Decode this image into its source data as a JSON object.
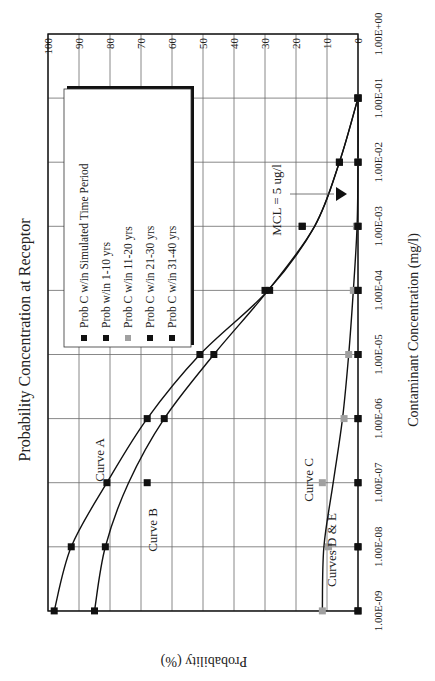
{
  "chart_data": {
    "type": "line",
    "title": "Probability Concentration at Receptor",
    "xlabel": "Contaminant Concentration (mg/l)",
    "ylabel": "Probability (%)",
    "orientation": "rotated 90 degrees clockwise (x-axis runs vertically on page)",
    "x_scale": "log",
    "xlim": [
      1e-09,
      1
    ],
    "ylim": [
      0,
      100
    ],
    "grid": true,
    "x_tick_labels": [
      "1.00E-09",
      "1.00E-08",
      "1.00E-07",
      "1.00E-06",
      "1.00E-05",
      "1.00E-04",
      "1.00E-03",
      "1.00E-02",
      "1.00E-01",
      "1.00E+00"
    ],
    "y_tick_labels": [
      "0",
      "10",
      "20",
      "30",
      "40",
      "50",
      "60",
      "70",
      "80",
      "90",
      "100"
    ],
    "x": [
      1e-09,
      1e-08,
      1e-07,
      1e-06,
      1e-05,
      0.0001,
      0.001,
      0.01,
      0.1
    ],
    "series": [
      {
        "name": "Prob C w/in Simulated Time Period",
        "curve_label": "Curve A",
        "marker_color": "#111111",
        "values": [
          98,
          92.5,
          81,
          68,
          51,
          30,
          18,
          6,
          0
        ]
      },
      {
        "name": "Prob w/in 1-10 yrs",
        "curve_label": "Curve B",
        "marker_color": "#111111",
        "values": [
          85,
          81.5,
          68,
          62.5,
          46.5,
          28.5,
          18,
          6,
          0
        ]
      },
      {
        "name": "Prob C w/in 11-20 yrs",
        "curve_label": "Curve C",
        "marker_color": "#a0a0a0",
        "values": [
          11.5,
          9.5,
          11.5,
          4.5,
          3,
          1.5,
          0.5,
          0,
          0
        ]
      },
      {
        "name": "Prob C w/in 21-30 yrs",
        "curve_label": "Curves D & E",
        "marker_color": "#111111",
        "values": [
          0,
          0,
          0,
          0,
          0,
          0,
          0,
          0,
          0
        ]
      },
      {
        "name": "Prob C w/in 31-40 yrs",
        "curve_label": "Curves D & E",
        "marker_color": "#111111",
        "values": [
          0,
          0,
          0,
          0,
          0,
          0,
          0,
          0,
          0
        ]
      }
    ],
    "curve_lines": {
      "A": [
        [
          1e-09,
          98
        ],
        [
          1e-08,
          92.5
        ],
        [
          1e-07,
          81
        ],
        [
          1e-06,
          68
        ],
        [
          1e-05,
          51
        ],
        [
          0.0001,
          29
        ],
        [
          0.001,
          14
        ],
        [
          0.01,
          6
        ],
        [
          0.1,
          0
        ]
      ],
      "B": [
        [
          1e-09,
          85
        ],
        [
          1e-08,
          81.5
        ],
        [
          1e-07,
          74
        ],
        [
          1e-06,
          62.5
        ],
        [
          1e-05,
          46.5
        ],
        [
          0.0001,
          29
        ],
        [
          0.001,
          14
        ],
        [
          0.01,
          6
        ],
        [
          0.1,
          0
        ]
      ],
      "C": [
        [
          1e-09,
          11.5
        ],
        [
          1e-08,
          11
        ],
        [
          1e-07,
          8
        ],
        [
          1e-06,
          5
        ],
        [
          1e-05,
          3
        ],
        [
          0.0001,
          1.5
        ],
        [
          0.001,
          0.3
        ],
        [
          0.01,
          0
        ],
        [
          0.1,
          0
        ]
      ]
    },
    "annotations": [
      {
        "text": "Curve A",
        "x": 3e-07,
        "y": 83
      },
      {
        "text": "Curve B",
        "x": 3e-08,
        "y": 66
      },
      {
        "text": "Curve C",
        "x": 2e-07,
        "y": 16
      },
      {
        "text": "Curves D & E",
        "x": 3e-08,
        "y": 11
      },
      {
        "text": "MCL = 5 ug/l",
        "x": 0.005,
        "y": 26,
        "marker": "triangle-down",
        "marker_x": 0.005,
        "marker_y": 6
      }
    ],
    "legend_position": "inside upper-left (rotated)"
  },
  "labels": {
    "title": "Probability Concentration at Receptor",
    "xlabel": "Contaminant Concentration (mg/l)",
    "ylabel": "Probability (%)",
    "mcl": "MCL = 5 ug/l",
    "curve_a": "Curve A",
    "curve_b": "Curve B",
    "curve_c": "Curve C",
    "curves_de": "Curves D & E"
  }
}
